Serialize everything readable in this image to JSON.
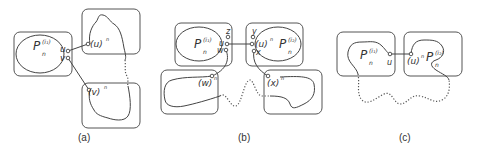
{
  "panels": [
    {
      "id": "a",
      "caption": "(a)",
      "labels": {
        "P": "P",
        "P_sub": "n",
        "P_sup": "(i₁)",
        "u": "u",
        "v": "v",
        "u_image": "(u)",
        "u_image_sup": "n",
        "v_image": "(v)",
        "v_image_sup": "n"
      }
    },
    {
      "id": "b",
      "caption": "(b)",
      "labels": {
        "P1": "P",
        "P1_sub": "n",
        "P1_sup": "(i₁)",
        "P2": "P",
        "P2_sub": "n",
        "P2_sup": "(i₂)",
        "z": "z",
        "u": "u",
        "w": "w",
        "y": "y",
        "x": "x",
        "u_image": "(u)",
        "u_image_sup": "n",
        "w_image": "(w)",
        "w_image_sup": "n",
        "x_image": "(x)",
        "x_image_sup": "n"
      }
    },
    {
      "id": "c",
      "caption": "(c)",
      "labels": {
        "P1": "P",
        "P1_sub": "n",
        "P1_sup": "(i₁)",
        "P2": "P",
        "P2_sub": "n",
        "P2_sup": "(i₂)",
        "u": "u",
        "u_image": "(u)",
        "u_image_sup": "n"
      }
    }
  ]
}
